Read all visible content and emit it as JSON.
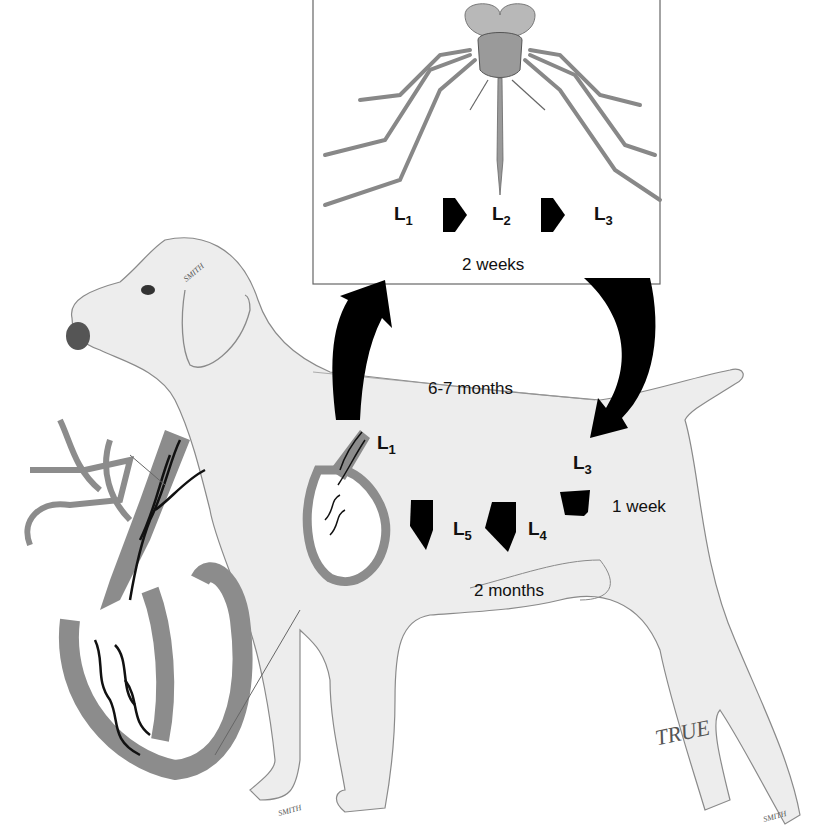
{
  "diagram": {
    "colors": {
      "dog_fill": "#ededed",
      "outline": "#888888",
      "heart_wall": "#8c8c8c",
      "arrows": "#000000",
      "mosquito_body": "#a8a8a8",
      "mosquito_box_border": "#666666"
    },
    "mosquito_box": {
      "stages": [
        {
          "label": "L",
          "sub": "1"
        },
        {
          "label": "L",
          "sub": "2"
        },
        {
          "label": "L",
          "sub": "3"
        }
      ],
      "duration": "2 weeks"
    },
    "transfer": {
      "to_mosquito_icon": "curved-arrow-up",
      "to_dog_icon": "curved-arrow-down",
      "prepatent_period": "6-7 months"
    },
    "dog": {
      "stage_to_mosquito": {
        "label": "L",
        "sub": "1"
      },
      "stage_from_mosquito": {
        "label": "L",
        "sub": "3"
      },
      "tissue_migration": [
        {
          "label": "L",
          "sub": "4"
        },
        {
          "label": "L",
          "sub": "5"
        }
      ],
      "durations": {
        "l3_to_l4": "1 week",
        "l4_to_l5": "2 months"
      }
    },
    "signatures": {
      "artist": "TRUE",
      "small_marks": [
        "SMITH",
        "SMITH",
        "SMITH"
      ]
    }
  }
}
